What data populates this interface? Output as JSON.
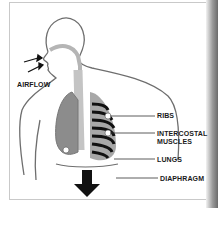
{
  "diagram": {
    "title": "",
    "labels": {
      "airflow": "AIRFLOW",
      "ribs": "RIBS",
      "intercostal_line1": "INTERCOSTAL",
      "intercostal_line2": "MUSCLES",
      "lungs": "LUNGS",
      "diaphragm": "DIAPHRAGM"
    },
    "icons": [
      "airflow-arrows",
      "down-arrow"
    ],
    "colors": {
      "outline": "#6e6e6e",
      "lung": "#8c8c8c",
      "airway": "#b5b5b5",
      "ribs": "#111111",
      "arrow": "#111111"
    }
  }
}
